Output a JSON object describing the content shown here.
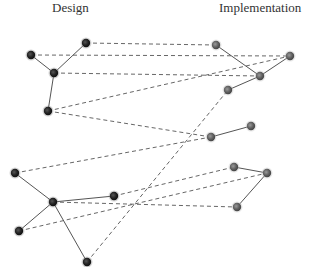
{
  "titles": {
    "left": "Design",
    "right": "Implementation"
  },
  "colors": {
    "design_node": "#2a2a2a",
    "implementation_node": "#6a6a6a",
    "solid_edge": "#555555",
    "dashed_edge": "#555555"
  },
  "nodes": {
    "design": [
      {
        "id": "d1",
        "x": 31,
        "y": 55
      },
      {
        "id": "d2",
        "x": 86,
        "y": 43
      },
      {
        "id": "d3",
        "x": 54,
        "y": 73
      },
      {
        "id": "d4",
        "x": 48,
        "y": 111
      },
      {
        "id": "d5",
        "x": 15,
        "y": 173
      },
      {
        "id": "d6",
        "x": 53,
        "y": 202
      },
      {
        "id": "d7",
        "x": 114,
        "y": 196
      },
      {
        "id": "d8",
        "x": 19,
        "y": 231
      },
      {
        "id": "d9",
        "x": 87,
        "y": 262
      }
    ],
    "implementation": [
      {
        "id": "i1",
        "x": 216,
        "y": 45
      },
      {
        "id": "i2",
        "x": 290,
        "y": 56
      },
      {
        "id": "i3",
        "x": 260,
        "y": 76
      },
      {
        "id": "i4",
        "x": 228,
        "y": 90
      },
      {
        "id": "i5",
        "x": 211,
        "y": 137
      },
      {
        "id": "i6",
        "x": 251,
        "y": 126
      },
      {
        "id": "i7",
        "x": 234,
        "y": 167
      },
      {
        "id": "i8",
        "x": 267,
        "y": 173
      },
      {
        "id": "i9",
        "x": 237,
        "y": 207
      }
    ]
  },
  "solid_edges": [
    [
      "d1",
      "d3"
    ],
    [
      "d2",
      "d3"
    ],
    [
      "d3",
      "d4"
    ],
    [
      "d5",
      "d6"
    ],
    [
      "d6",
      "d7"
    ],
    [
      "d6",
      "d8"
    ],
    [
      "d6",
      "d9"
    ],
    [
      "i1",
      "i3"
    ],
    [
      "i2",
      "i3"
    ],
    [
      "i3",
      "i4"
    ],
    [
      "i5",
      "i6"
    ],
    [
      "i7",
      "i8"
    ],
    [
      "i8",
      "i9"
    ]
  ],
  "dashed_edges": [
    [
      "d2",
      "i1"
    ],
    [
      "d1",
      "i2"
    ],
    [
      "d3",
      "i3"
    ],
    [
      "d4",
      "i2"
    ],
    [
      "d4",
      "i5"
    ],
    [
      "d5",
      "i5"
    ],
    [
      "d9",
      "i4"
    ],
    [
      "d7",
      "i7"
    ],
    [
      "d8",
      "i8"
    ],
    [
      "d6",
      "i9"
    ]
  ]
}
